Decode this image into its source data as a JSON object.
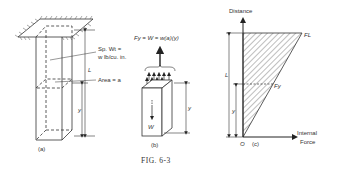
{
  "figure": {
    "caption": "FIG. 6-3",
    "panels": {
      "a": {
        "label": "(a)",
        "sp_wt_line1": "Sp. Wt =",
        "sp_wt_line2": "w lb/cu. in.",
        "length_label": "L",
        "area_label": "Area = a",
        "height_label": "y"
      },
      "b": {
        "label": "(b)",
        "force_equation": "Fy = W = w(a)(y)",
        "weight_label": "W",
        "height_label": "y"
      },
      "c": {
        "label": "(c)",
        "y_axis_label": "Distance",
        "x_axis_label_line1": "Internal",
        "x_axis_label_line2": "Force",
        "origin_label": "O",
        "top_force_label": "FL",
        "mid_force_label": "Fy",
        "length_label": "L",
        "height_label": "y"
      }
    }
  }
}
